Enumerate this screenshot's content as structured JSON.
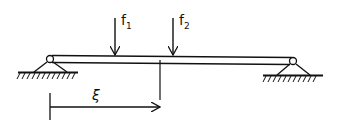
{
  "diagram": {
    "loads": [
      {
        "label": "f",
        "subscript": "1",
        "x": 115
      },
      {
        "label": "f",
        "subscript": "2",
        "x": 173
      }
    ],
    "coordinate": {
      "label": "ξ",
      "from_x": 50,
      "to_x": 160
    },
    "supports": [
      "left-pin-support",
      "right-pin-support"
    ],
    "colors": {
      "ink": "#111111",
      "background": "#ffffff"
    }
  }
}
